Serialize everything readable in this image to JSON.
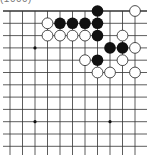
{
  "caption": {
    "text": "(1000)",
    "note": "clipped at top edge; only a sliver visible, text is a best guess and unverified"
  },
  "board": {
    "view": "upper-right corner, top edge visible, right side cut off",
    "columns_x": [
      10,
      22.5,
      35,
      47.5,
      60,
      72.5,
      85,
      97.5,
      110,
      122.5,
      135
    ],
    "rows_y": [
      11,
      23.3,
      35.6,
      47.9,
      60.2,
      72.5,
      84.8,
      97.1,
      109.4,
      121.7,
      134,
      146.3
    ],
    "grid_left": 3,
    "grid_right": 147,
    "grid_bottom": 155,
    "line_color": "#333333",
    "edge_line_width": 1.6,
    "star_points": [
      {
        "col": 2,
        "row": 3
      },
      {
        "col": 2,
        "row": 9
      },
      {
        "col": 8,
        "row": 9
      }
    ],
    "stones": [
      {
        "color": "black",
        "col": 7,
        "row": 0
      },
      {
        "color": "white",
        "col": 10,
        "row": 0
      },
      {
        "color": "white",
        "col": 3,
        "row": 1
      },
      {
        "color": "black",
        "col": 4,
        "row": 1
      },
      {
        "color": "black",
        "col": 5,
        "row": 1
      },
      {
        "color": "black",
        "col": 6,
        "row": 1
      },
      {
        "color": "black",
        "col": 7,
        "row": 1
      },
      {
        "color": "white",
        "col": 3,
        "row": 2
      },
      {
        "color": "white",
        "col": 4,
        "row": 2
      },
      {
        "color": "white",
        "col": 5,
        "row": 2
      },
      {
        "color": "white",
        "col": 6,
        "row": 2
      },
      {
        "color": "black",
        "col": 7,
        "row": 2
      },
      {
        "color": "white",
        "col": 9,
        "row": 2
      },
      {
        "color": "black",
        "col": 8,
        "row": 3
      },
      {
        "color": "black",
        "col": 9,
        "row": 3
      },
      {
        "color": "white",
        "col": 10,
        "row": 3
      },
      {
        "color": "white",
        "col": 6,
        "row": 4
      },
      {
        "color": "black",
        "col": 7,
        "row": 4
      },
      {
        "color": "white",
        "col": 9,
        "row": 4
      },
      {
        "color": "white",
        "col": 7,
        "row": 5
      },
      {
        "color": "white",
        "col": 8,
        "row": 5
      },
      {
        "color": "white",
        "col": 10,
        "row": 5
      }
    ],
    "colors": {
      "black_stone": "#111111",
      "white_stone": "#ffffff",
      "white_stroke": "#222222"
    }
  }
}
